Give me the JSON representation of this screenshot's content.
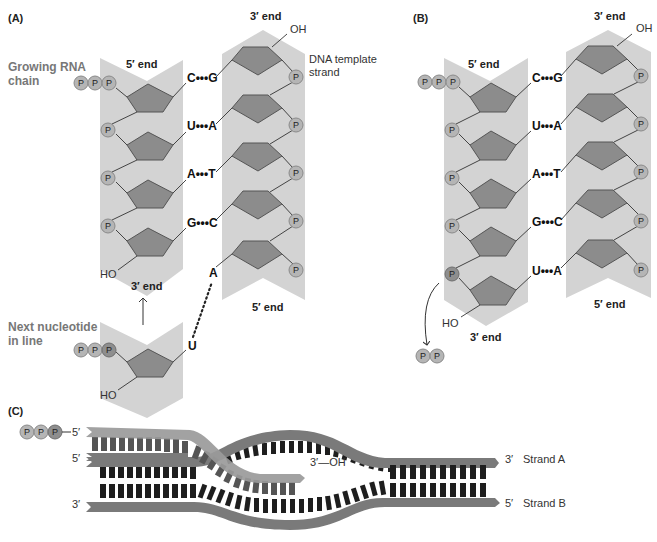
{
  "panels": {
    "A": {
      "label": "(A)",
      "rna_strand": {
        "title": "Growing RNA chain",
        "title_line1": "Growing RNA",
        "title_line2": "chain",
        "top_end": "5′ end",
        "bottom_end": "3′ end",
        "terminal_group": "HO",
        "triphosphate": [
          "P",
          "P",
          "P"
        ],
        "phosphate": "P"
      },
      "dna_strand": {
        "title_line1": "DNA template",
        "title_line2": "strand",
        "top_end": "3′ end",
        "bottom_end": "5′ end",
        "terminal_group": "OH",
        "phosphate": "P"
      },
      "base_pairs": [
        {
          "rna": "C",
          "dna": "G",
          "bond": "•••"
        },
        {
          "rna": "U",
          "dna": "A",
          "bond": "•••"
        },
        {
          "rna": "A",
          "dna": "T",
          "bond": "•••"
        },
        {
          "rna": "G",
          "dna": "C",
          "bond": "•••"
        }
      ],
      "unpaired_template_base": "A",
      "next_nucleotide": {
        "title_line1": "Next nucleotide",
        "title_line2": "in line",
        "base": "U",
        "terminal_group": "HO",
        "triphosphate": [
          "P",
          "P",
          "P"
        ]
      }
    },
    "B": {
      "label": "(B)",
      "rna_strand": {
        "top_end": "5′ end",
        "bottom_end": "3′ end",
        "terminal_group": "HO",
        "triphosphate": [
          "P",
          "P",
          "P"
        ],
        "phosphate": "P"
      },
      "dna_strand": {
        "top_end": "3′ end",
        "bottom_end": "5′ end",
        "terminal_group": "OH",
        "phosphate": "P"
      },
      "base_pairs": [
        {
          "rna": "C",
          "dna": "G",
          "bond": "•••"
        },
        {
          "rna": "U",
          "dna": "A",
          "bond": "•••"
        },
        {
          "rna": "A",
          "dna": "T",
          "bond": "•••"
        },
        {
          "rna": "G",
          "dna": "C",
          "bond": "•••"
        },
        {
          "rna": "U",
          "dna": "A",
          "bond": "•••"
        }
      ],
      "released_pyrophosphate": [
        "P",
        "P"
      ]
    },
    "C": {
      "label": "(C)",
      "rna": {
        "triphosphate": [
          "P",
          "P",
          "P"
        ],
        "five_prime": "5′",
        "three_prime_end": "3′—OH"
      },
      "strand_a": {
        "left_end": "5′",
        "right_end": "3′",
        "name": "Strand A"
      },
      "strand_b": {
        "left_end": "3′",
        "right_end": "5′",
        "name": "Strand B"
      }
    }
  },
  "colors": {
    "strand_background": "#d3d3d3",
    "sugar": "#8c8c8c",
    "phosphate": "#b5b5b5",
    "backbone": "#7a7a7a",
    "rung": "#1e1e1e"
  }
}
